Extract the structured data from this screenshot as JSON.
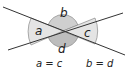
{
  "diagram": {
    "angles": [
      {
        "name": "a",
        "label": "a",
        "fill": "#e2e2e2",
        "position": "left"
      },
      {
        "name": "b",
        "label": "b",
        "fill": "#c8c8c8",
        "position": "top"
      },
      {
        "name": "c",
        "label": "c",
        "fill": "#e2e2e2",
        "position": "right"
      },
      {
        "name": "d",
        "label": "d",
        "fill": "#c8c8c8",
        "position": "bottom"
      }
    ],
    "equations": [
      {
        "text": "a = c"
      },
      {
        "text": "b = d"
      }
    ],
    "colors": {
      "line": "#333333",
      "arc_stroke": "#666666"
    }
  }
}
